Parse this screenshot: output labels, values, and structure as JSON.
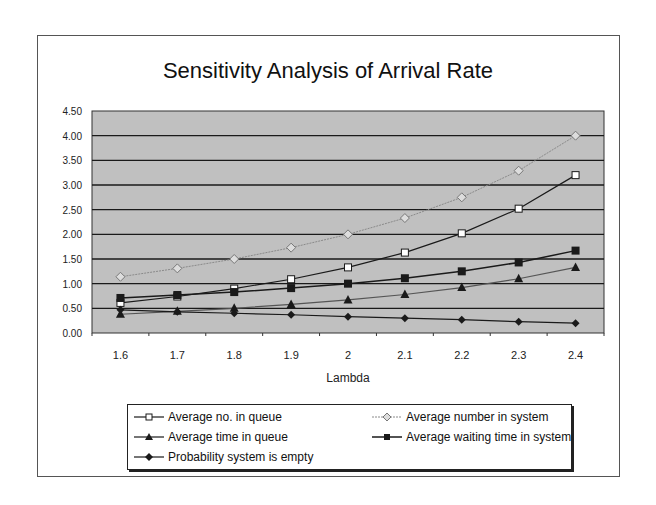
{
  "chart": {
    "title": "Sensitivity Analysis of Arrival Rate",
    "xlabel": "Lambda",
    "yticks": [
      "0.00",
      "0.50",
      "1.00",
      "1.50",
      "2.00",
      "2.50",
      "3.00",
      "3.50",
      "4.00",
      "4.50"
    ],
    "xticks": [
      "1.6",
      "1.7",
      "1.8",
      "1.9",
      "2",
      "2.1",
      "2.2",
      "2.3",
      "2.4"
    ]
  },
  "legend": {
    "items": [
      {
        "label": "Average no. in queue",
        "marker": "open-square"
      },
      {
        "label": "Average number in system",
        "marker": "open-diamond"
      },
      {
        "label": "Average time in queue",
        "marker": "filled-triangle"
      },
      {
        "label": "Average waiting time in system",
        "marker": "filled-square"
      },
      {
        "label": "Probability system is empty",
        "marker": "filled-diamond"
      }
    ]
  },
  "colors": {
    "plot_background": "#c0c0c0",
    "gridline": "#1a1a1a",
    "series_dark": "#1a1a1a",
    "series_light": "#8a8a8a"
  },
  "chart_data": {
    "type": "line",
    "title": "Sensitivity Analysis of Arrival Rate",
    "xlabel": "Lambda",
    "ylabel": "",
    "ylim": [
      0,
      4.5
    ],
    "grid": true,
    "legend_position": "bottom",
    "categories": [
      1.6,
      1.7,
      1.8,
      1.9,
      2.0,
      2.1,
      2.2,
      2.3,
      2.4
    ],
    "series": [
      {
        "name": "Average no. in queue",
        "values": [
          0.61,
          0.74,
          0.9,
          1.09,
          1.33,
          1.63,
          2.02,
          2.52,
          3.2
        ]
      },
      {
        "name": "Average number in system",
        "values": [
          1.14,
          1.31,
          1.5,
          1.73,
          2.0,
          2.33,
          2.75,
          3.29,
          4.0
        ]
      },
      {
        "name": "Average time in queue",
        "values": [
          0.38,
          0.44,
          0.5,
          0.58,
          0.67,
          0.78,
          0.92,
          1.1,
          1.33
        ]
      },
      {
        "name": "Average waiting time in system",
        "values": [
          0.71,
          0.77,
          0.83,
          0.91,
          1.0,
          1.11,
          1.25,
          1.43,
          1.67
        ]
      },
      {
        "name": "Probability system is empty",
        "values": [
          0.47,
          0.43,
          0.4,
          0.37,
          0.33,
          0.3,
          0.27,
          0.23,
          0.2
        ]
      }
    ]
  }
}
